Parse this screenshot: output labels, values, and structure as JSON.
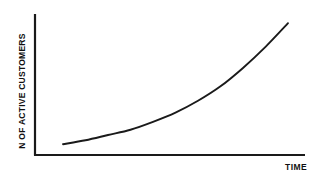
{
  "chart_data": {
    "type": "line",
    "title": "",
    "subtitle": "",
    "xlabel": "TIME",
    "ylabel": "N OF ACTIVE CUSTOMERS",
    "legend": [],
    "annotations": [],
    "grid": false,
    "axis_ticks": false,
    "tick_labels": {
      "x": [],
      "y": []
    },
    "xlim": [
      0,
      1
    ],
    "ylim": [
      0,
      1
    ],
    "series": [
      {
        "name": "Active customers",
        "shape": "exponential",
        "x": [
          0.0,
          0.1,
          0.2,
          0.3,
          0.4,
          0.5,
          0.6,
          0.7,
          0.8,
          0.9,
          1.0
        ],
        "y": [
          0.08,
          0.11,
          0.15,
          0.19,
          0.25,
          0.32,
          0.41,
          0.52,
          0.66,
          0.82,
          1.0
        ]
      }
    ]
  },
  "colors": {
    "background": "#ffffff",
    "axis": "#1a1a1a",
    "curve": "#1a1a1a",
    "label_text": "#111111"
  },
  "axes": {
    "y_axis_name": "vertical-axis-line",
    "x_axis_name": "horizontal-axis-line"
  }
}
